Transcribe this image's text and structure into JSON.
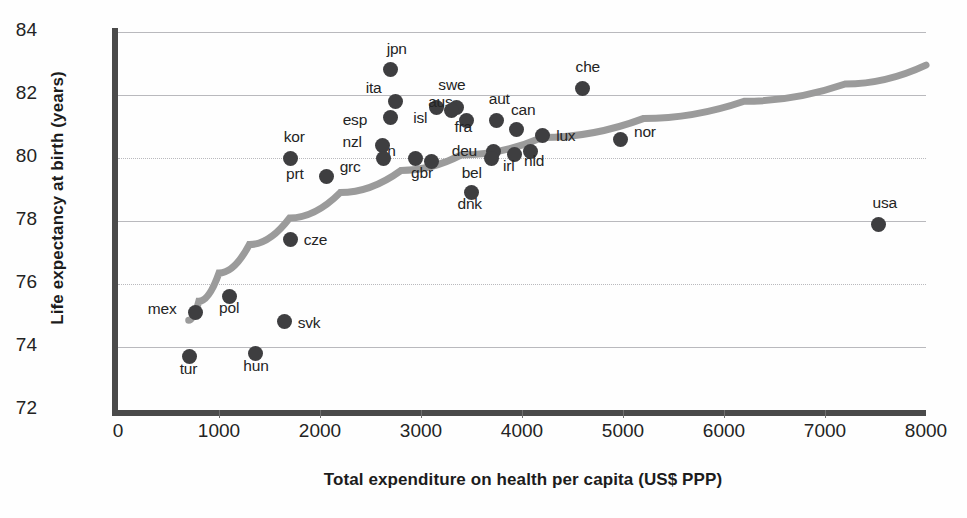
{
  "chart_data": {
    "type": "scatter",
    "title": "",
    "xlabel": "Total expenditure on health per capita (US$ PPP)",
    "ylabel": "Life expectancy at birth (years)",
    "xlim": [
      0,
      8000
    ],
    "ylim": [
      72,
      84
    ],
    "xticks": [
      0,
      1000,
      2000,
      3000,
      4000,
      5000,
      6000,
      7000,
      8000
    ],
    "yticks": [
      72,
      74,
      76,
      78,
      80,
      82,
      84
    ],
    "grid": true,
    "legend": null,
    "point_color": "#3e3e40",
    "trend_color": "#9b9b9b",
    "points": [
      {
        "label": "jpn",
        "x": 2700,
        "y": 82.8,
        "label_dx": -4,
        "label_dy": -22
      },
      {
        "label": "ita",
        "x": 2750,
        "y": 81.8,
        "label_dx": -30,
        "label_dy": -14
      },
      {
        "label": "esp",
        "x": 2700,
        "y": 81.3,
        "label_dx": -48,
        "label_dy": 2
      },
      {
        "label": "aus",
        "x": 3150,
        "y": 81.6,
        "label_dx": -8,
        "label_dy": -7
      },
      {
        "label": "swe",
        "x": 3350,
        "y": 81.6,
        "label_dx": -18,
        "label_dy": -24
      },
      {
        "label": "isl",
        "x": 3300,
        "y": 81.5,
        "label_dx": -38,
        "label_dy": 6
      },
      {
        "label": "fra",
        "x": 3450,
        "y": 81.2,
        "label_dx": -12,
        "label_dy": 6
      },
      {
        "label": "aut",
        "x": 3750,
        "y": 81.2,
        "label_dx": -8,
        "label_dy": -22
      },
      {
        "label": "che",
        "x": 4600,
        "y": 82.2,
        "label_dx": -7,
        "label_dy": -23
      },
      {
        "label": "can",
        "x": 3950,
        "y": 80.9,
        "label_dx": -6,
        "label_dy": -21
      },
      {
        "label": "nor",
        "x": 4980,
        "y": 80.6,
        "label_dx": 13,
        "label_dy": -8
      },
      {
        "label": "lux",
        "x": 4200,
        "y": 80.7,
        "label_dx": 14,
        "label_dy": -1
      },
      {
        "label": "nld",
        "x": 4080,
        "y": 80.2,
        "label_dx": -6,
        "label_dy": 8
      },
      {
        "label": "irl",
        "x": 3930,
        "y": 80.1,
        "label_dx": -12,
        "label_dy": 10
      },
      {
        "label": "deu",
        "x": 3720,
        "y": 80.2,
        "label_dx": -42,
        "label_dy": -2
      },
      {
        "label": "bel",
        "x": 3700,
        "y": 80.0,
        "label_dx": -30,
        "label_dy": 14
      },
      {
        "label": "dnk",
        "x": 3500,
        "y": 78.9,
        "label_dx": -14,
        "label_dy": 10
      },
      {
        "label": "fin",
        "x": 2950,
        "y": 80.0,
        "label_dx": -36,
        "label_dy": -8
      },
      {
        "label": "gbr",
        "x": 3100,
        "y": 79.9,
        "label_dx": -20,
        "label_dy": 11
      },
      {
        "label": "nzl",
        "x": 2620,
        "y": 80.4,
        "label_dx": -40,
        "label_dy": -4
      },
      {
        "label": "grc",
        "x": 2630,
        "y": 80.0,
        "label_dx": -44,
        "label_dy": 8
      },
      {
        "label": "kor",
        "x": 1710,
        "y": 80.0,
        "label_dx": -7,
        "label_dy": -22
      },
      {
        "label": "prt",
        "x": 2060,
        "y": 79.4,
        "label_dx": -40,
        "label_dy": -4
      },
      {
        "label": "cze",
        "x": 1710,
        "y": 77.4,
        "label_dx": 13,
        "label_dy": -1
      },
      {
        "label": "mex",
        "x": 770,
        "y": 75.1,
        "label_dx": -48,
        "label_dy": -4
      },
      {
        "label": "pol",
        "x": 1100,
        "y": 75.6,
        "label_dx": -10,
        "label_dy": 10
      },
      {
        "label": "svk",
        "x": 1650,
        "y": 74.8,
        "label_dx": 13,
        "label_dy": 0
      },
      {
        "label": "tur",
        "x": 710,
        "y": 73.7,
        "label_dx": -10,
        "label_dy": 12
      },
      {
        "label": "hun",
        "x": 1360,
        "y": 73.8,
        "label_dx": -12,
        "label_dy": 12
      },
      {
        "label": "usa",
        "x": 7530,
        "y": 77.9,
        "label_dx": -6,
        "label_dy": -22
      }
    ],
    "trend_line": {
      "description": "logarithmic fit of life expectancy vs health expenditure",
      "points": [
        {
          "x": 700,
          "y": 74.85
        },
        {
          "x": 800,
          "y": 75.45
        },
        {
          "x": 1000,
          "y": 76.35
        },
        {
          "x": 1300,
          "y": 77.25
        },
        {
          "x": 1700,
          "y": 78.1
        },
        {
          "x": 2200,
          "y": 78.9
        },
        {
          "x": 2800,
          "y": 79.6
        },
        {
          "x": 3400,
          "y": 80.1
        },
        {
          "x": 4200,
          "y": 80.65
        },
        {
          "x": 5200,
          "y": 81.25
        },
        {
          "x": 6200,
          "y": 81.8
        },
        {
          "x": 7200,
          "y": 82.35
        },
        {
          "x": 8000,
          "y": 82.95
        }
      ]
    }
  }
}
